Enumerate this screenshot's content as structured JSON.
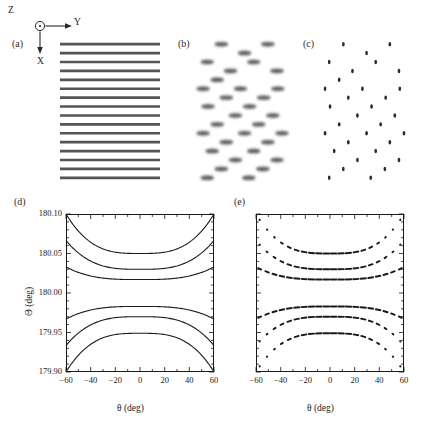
{
  "figure": {
    "width": 425,
    "height": 438,
    "background": "#ffffff",
    "ink": "#1a1a1a"
  },
  "axes_indicator": {
    "z_label": "Z",
    "y_label": "Y",
    "x_label": "X",
    "z_icon": "circle-dot-out-of-page-icon",
    "y_icon": "arrow-right-icon",
    "x_icon": "arrow-down-icon"
  },
  "panels": [
    {
      "key": "a",
      "label": "(a)",
      "type": "schematic-lines"
    },
    {
      "key": "b",
      "label": "(b)",
      "type": "schematic-dashes"
    },
    {
      "key": "c",
      "label": "(c)",
      "type": "schematic-dots"
    },
    {
      "key": "d",
      "label": "(d)",
      "type": "line-plot"
    },
    {
      "key": "e",
      "label": "(e)",
      "type": "scatter-plot"
    }
  ],
  "schematic_a": {
    "line_count": 16,
    "line_color": "#555555",
    "line_width": 1.9,
    "x_start": 0,
    "x_end": 100,
    "y_first": 3,
    "y_spacing": 6.4
  },
  "schematic_b": {
    "dash_color": "#555555",
    "dash_length": 17,
    "dash_thickness": 3.2,
    "rows": [
      {
        "y": 3,
        "xs": [
          22,
          78
        ]
      },
      {
        "y": 9.4,
        "xs": [
          50
        ]
      },
      {
        "y": 15.8,
        "xs": [
          5,
          61
        ]
      },
      {
        "y": 22.2,
        "xs": [
          33,
          89
        ]
      },
      {
        "y": 28.6,
        "xs": [
          17
        ]
      },
      {
        "y": 35.0,
        "xs": [
          0,
          45,
          90
        ]
      },
      {
        "y": 41.4,
        "xs": [
          28,
          73
        ]
      },
      {
        "y": 47.8,
        "xs": [
          6,
          56
        ]
      },
      {
        "y": 54.2,
        "xs": [
          39,
          84
        ]
      },
      {
        "y": 60.6,
        "xs": [
          17,
          67
        ]
      },
      {
        "y": 67.0,
        "xs": [
          0,
          50,
          95
        ]
      },
      {
        "y": 73.4,
        "xs": [
          28,
          78
        ]
      },
      {
        "y": 79.8,
        "xs": [
          11,
          61
        ]
      },
      {
        "y": 86.2,
        "xs": [
          39,
          89
        ]
      },
      {
        "y": 92.6,
        "xs": [
          22,
          72
        ]
      },
      {
        "y": 99.0,
        "xs": [
          5,
          55
        ]
      }
    ]
  },
  "schematic_c": {
    "dot_color": "#2b2b2b",
    "dot_radius": 1.6,
    "rows": [
      {
        "y": 3,
        "xs": [
          22,
          78
        ]
      },
      {
        "y": 9.4,
        "xs": [
          50
        ]
      },
      {
        "y": 15.8,
        "xs": [
          5,
          61
        ]
      },
      {
        "y": 22.2,
        "xs": [
          33,
          89
        ]
      },
      {
        "y": 28.6,
        "xs": [
          17
        ]
      },
      {
        "y": 35.0,
        "xs": [
          0,
          45,
          90
        ]
      },
      {
        "y": 41.4,
        "xs": [
          28,
          73
        ]
      },
      {
        "y": 47.8,
        "xs": [
          6,
          56
        ]
      },
      {
        "y": 54.2,
        "xs": [
          39,
          84
        ]
      },
      {
        "y": 60.6,
        "xs": [
          17,
          67
        ]
      },
      {
        "y": 67.0,
        "xs": [
          0,
          50,
          95
        ]
      },
      {
        "y": 73.4,
        "xs": [
          28,
          78
        ]
      },
      {
        "y": 79.8,
        "xs": [
          11,
          61
        ]
      },
      {
        "y": 86.2,
        "xs": [
          39,
          89
        ]
      },
      {
        "y": 92.6,
        "xs": [
          22,
          72
        ]
      },
      {
        "y": 99.0,
        "xs": [
          5,
          55
        ]
      }
    ]
  },
  "chart_data": [
    {
      "id": "panel-d",
      "type": "line",
      "title": "",
      "xlabel": "θ (deg)",
      "ylabel": "Θ (deg)",
      "xlim": [
        -60,
        60
      ],
      "ylim": [
        179.9,
        180.1
      ],
      "xticks": [
        -60,
        -40,
        -20,
        0,
        20,
        40,
        60
      ],
      "xticklabels": [
        "−60",
        "−40",
        "−20",
        "0",
        "20",
        "40",
        "60"
      ],
      "yticks": [
        179.9,
        179.95,
        180.0,
        180.05,
        180.1
      ],
      "yticklabels": [
        "179.90",
        "179.95",
        "180.00",
        "180.05",
        "180.10"
      ],
      "minor_ticks": true,
      "grid": false,
      "legend": null,
      "series": [
        {
          "name": "branch-1",
          "edge": 180.1,
          "center": 180.05
        },
        {
          "name": "branch-2",
          "edge": 180.0665,
          "center": 180.03
        },
        {
          "name": "branch-3",
          "edge": 180.033,
          "center": 180.017
        },
        {
          "name": "branch-4",
          "edge": 179.967,
          "center": 179.983
        },
        {
          "name": "branch-5",
          "edge": 179.9335,
          "center": 179.97
        },
        {
          "name": "branch-6",
          "edge": 179.9,
          "center": 179.949
        }
      ]
    },
    {
      "id": "panel-e",
      "type": "scatter",
      "title": "",
      "xlabel": "θ (deg)",
      "ylabel": "",
      "xlim": [
        -60,
        60
      ],
      "ylim": [
        179.9,
        180.1
      ],
      "xticks": [
        -60,
        -40,
        -20,
        0,
        20,
        40,
        60
      ],
      "xticklabels": [
        "−60",
        "−40",
        "−20",
        "0",
        "20",
        "40",
        "60"
      ],
      "yticks": [
        179.9,
        179.95,
        180.0,
        180.05,
        180.1
      ],
      "yticklabels": [],
      "minor_ticks": true,
      "grid": false,
      "legend": null,
      "marker": "dash",
      "sample_x": [
        -57,
        -51,
        -45,
        -39,
        -33,
        -27,
        -21,
        -15,
        -9,
        -3,
        3,
        9,
        15,
        21,
        27,
        33,
        39,
        45,
        51,
        57
      ],
      "series": [
        {
          "name": "branch-1",
          "edge": 180.1,
          "center": 180.05
        },
        {
          "name": "branch-2",
          "edge": 180.0665,
          "center": 180.03
        },
        {
          "name": "branch-3",
          "edge": 180.033,
          "center": 180.017
        },
        {
          "name": "branch-4",
          "edge": 179.967,
          "center": 179.983
        },
        {
          "name": "branch-5",
          "edge": 179.9335,
          "center": 179.97
        },
        {
          "name": "branch-6",
          "edge": 179.9,
          "center": 179.949
        }
      ]
    }
  ]
}
